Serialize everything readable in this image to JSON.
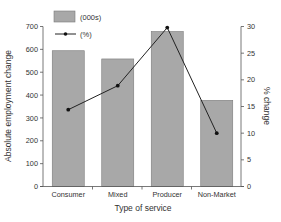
{
  "chart_data": {
    "type": "bar",
    "title": "",
    "xlabel": "Type of service",
    "ylabel": "Absolute employment change",
    "y2label": "% change",
    "categories": [
      "Consumer",
      "Mixed",
      "Producer",
      "Non-Market"
    ],
    "series": [
      {
        "name": "(000s)",
        "type": "bar",
        "axis": "left",
        "values": [
          594,
          558,
          678,
          377
        ]
      },
      {
        "name": "(%)",
        "type": "line",
        "axis": "right",
        "values": [
          14.4,
          18.9,
          29.8,
          10.0
        ]
      }
    ],
    "ylim": [
      0,
      700
    ],
    "y2lim": [
      0,
      30
    ],
    "yticks": [
      0,
      100,
      200,
      300,
      400,
      500,
      600,
      700
    ],
    "y2ticks": [
      0,
      5,
      10,
      15,
      20,
      25,
      30
    ],
    "grid": false,
    "legend_position": "top-left",
    "colors": {
      "bar_fill": "#a8a8a8",
      "bar_stroke": "#7a7a7a",
      "line": "#222222",
      "axis": "#555555"
    }
  },
  "legend": [
    {
      "label": "(000s)",
      "kind": "bar"
    },
    {
      "label": "(%)",
      "kind": "line"
    }
  ]
}
